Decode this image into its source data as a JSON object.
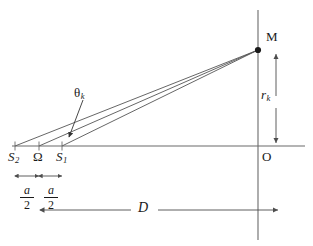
{
  "figure": {
    "kind": "optics-geometry-diagram",
    "background_color": "#ffffff",
    "line_color": "#4d4d4d",
    "text_color": "#1a1a1a"
  },
  "points": {
    "s2": {
      "label": "S",
      "subscript": "2",
      "x": 15,
      "y": 146
    },
    "omega": {
      "label": "Ω",
      "subscript": "",
      "x": 39,
      "y": 146
    },
    "s1": {
      "label": "S",
      "subscript": "1",
      "x": 62,
      "y": 146
    },
    "origin": {
      "label": "O",
      "subscript": "",
      "x": 258,
      "y": 146
    },
    "screen_point": {
      "label": "M",
      "subscript": "",
      "x": 258,
      "y": 50
    }
  },
  "angle": {
    "label": "θ",
    "subscript": "k",
    "text_x": 75,
    "text_y": 88,
    "pointer_from_x": 83,
    "pointer_from_y": 100,
    "pointer_to_x": 69,
    "pointer_to_y": 138
  },
  "dimensions": {
    "half_separation_left": {
      "numerator": "a",
      "denominator": "2",
      "from_x": 15,
      "to_x": 39,
      "y": 176
    },
    "half_separation_right": {
      "numerator": "a",
      "denominator": "2",
      "from_x": 39,
      "to_x": 62,
      "y": 176
    },
    "screen_distance": {
      "label": "D",
      "from_x": 40,
      "to_x": 278,
      "y": 210
    },
    "fringe_height": {
      "label": "r",
      "subscript": "k",
      "from_y": 50,
      "to_y": 146,
      "x": 276
    }
  },
  "axes": {
    "horizontal": {
      "x1": 12,
      "x2": 305,
      "y": 146
    },
    "vertical_screen": {
      "x": 258,
      "y1": 10,
      "y2": 240
    }
  },
  "rays": [
    {
      "name": "ray-from-s2",
      "x1": 15,
      "y1": 146,
      "x2": 258,
      "y2": 50
    },
    {
      "name": "ray-from-omega",
      "x1": 39,
      "y1": 146,
      "x2": 258,
      "y2": 50
    },
    {
      "name": "ray-from-s1",
      "x1": 62,
      "y1": 146,
      "x2": 258,
      "y2": 50
    }
  ]
}
